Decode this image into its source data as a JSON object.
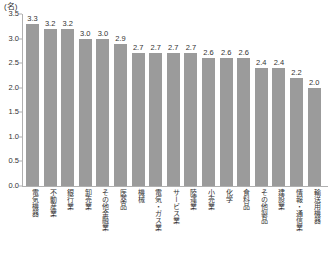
{
  "chart_data": {
    "type": "bar",
    "title": "",
    "xlabel": "",
    "ylabel": "",
    "unit_label": "(名)",
    "ylim": [
      0.0,
      3.5
    ],
    "ytick_labels": [
      "3.5",
      "3.0",
      "2.5",
      "2.0",
      "1.5",
      "1.0",
      "0.5",
      "0.0"
    ],
    "ytick_values": [
      3.5,
      3.0,
      2.5,
      2.0,
      1.5,
      1.0,
      0.5,
      0.0
    ],
    "grid": false,
    "legend": null,
    "bar_color": "#9b9b9b",
    "axis_color": "#b0b0b0",
    "text_color": "#333333",
    "categories": [
      "電気機器",
      "不動産業",
      "銀行業",
      "卸売業",
      "その他金融業",
      "医薬品",
      "機械",
      "電気・ガス業",
      "サービス業",
      "陸運業",
      "小売業",
      "化学",
      "食料品",
      "その他製品",
      "建設業",
      "情報・通信業",
      "輸送用機器"
    ],
    "values": [
      3.3,
      3.2,
      3.2,
      3.0,
      3.0,
      2.9,
      2.7,
      2.7,
      2.7,
      2.7,
      2.6,
      2.6,
      2.6,
      2.4,
      2.4,
      2.2,
      2.0
    ],
    "value_labels": [
      "3.3",
      "3.2",
      "3.2",
      "3.0",
      "3.0",
      "2.9",
      "2.7",
      "2.7",
      "2.7",
      "2.7",
      "2.6",
      "2.6",
      "2.6",
      "2.4",
      "2.4",
      "2.2",
      "2.0"
    ]
  }
}
